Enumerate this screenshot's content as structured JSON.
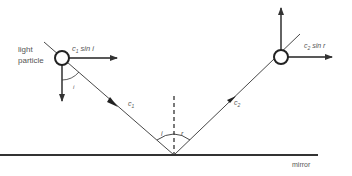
{
  "diagram": {
    "labels": {
      "particle_line1": "light",
      "particle_line2": "particle",
      "incident_horizontal": "c",
      "incident_horizontal_sub": "1",
      "incident_horizontal_tail": " sin i",
      "reflected_horizontal": "c",
      "reflected_horizontal_sub": "2",
      "reflected_horizontal_tail": " sin r",
      "incident_speed": "c",
      "incident_speed_sub": "1",
      "reflected_speed": "c",
      "reflected_speed_sub": "2",
      "angle_incidence": "i",
      "angle_particle": "i",
      "angle_reflection": "r",
      "mirror": "mirror"
    },
    "colors": {
      "line": "#333333",
      "text": "#555555",
      "background": "#ffffff"
    }
  }
}
